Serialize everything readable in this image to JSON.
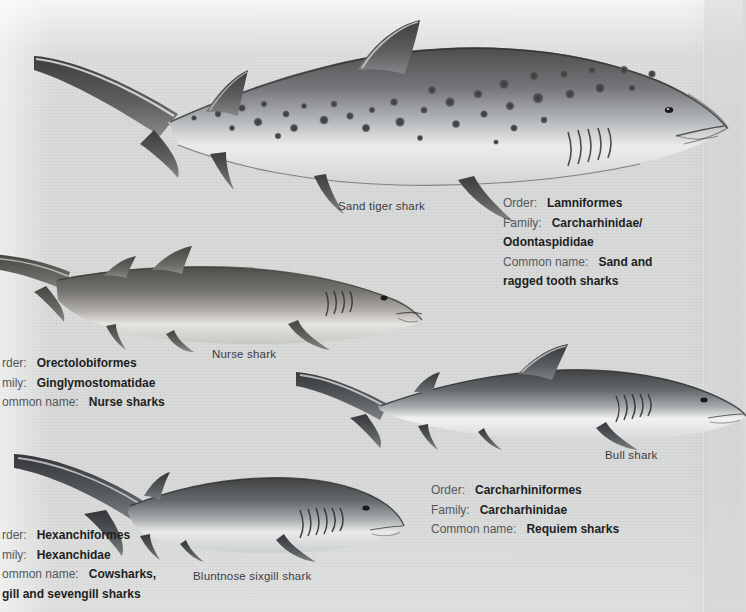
{
  "page": {
    "background_color": "#d7d8d8",
    "ink_color": "#1d1f22"
  },
  "figures": [
    {
      "id": "sand-tiger-shark",
      "caption": "Sand tiger shark",
      "pattern": "spotted",
      "body_color": "#6a6b6c",
      "belly_color": "#eceded",
      "gill_slits": 5
    },
    {
      "id": "nurse-shark",
      "caption": "Nurse shark",
      "pattern": "plain",
      "body_color": "#75736e",
      "belly_color": "#dedcd7",
      "gill_slits": 4
    },
    {
      "id": "bull-shark",
      "caption": "Bull shark",
      "pattern": "plain",
      "body_color": "#5e6163",
      "belly_color": "#f2f3f3",
      "gill_slits": 5
    },
    {
      "id": "bluntnose-sixgill-shark",
      "caption": "Bluntnose sixgill shark",
      "pattern": "plain",
      "body_color": "#5f6163",
      "belly_color": "#e9eaea",
      "gill_slits": 6
    }
  ],
  "taxon_blocks": [
    {
      "id": "lamniformes",
      "order_label": "Order:",
      "order_value": "Lamniformes",
      "family_label": "Family:",
      "family_value": "Carcharhinidae/",
      "family_value_2": "Odontaspididae",
      "common_label": "Common name:",
      "common_value": "Sand and",
      "common_value_2": "ragged tooth sharks"
    },
    {
      "id": "orectolobiformes",
      "order_label": "rder:",
      "order_value": "Orectolobiformes",
      "family_label": "mily:",
      "family_value": "Ginglymostomatidae",
      "common_label": "ommon name:",
      "common_value": "Nurse sharks"
    },
    {
      "id": "carcharhiniformes",
      "order_label": "Order:",
      "order_value": "Carcharhiniformes",
      "family_label": "Family:",
      "family_value": "Carcharhinidae",
      "common_label": "Common name:",
      "common_value": "Requiem sharks"
    },
    {
      "id": "hexanchiformes",
      "order_label": "rder:",
      "order_value": "Hexanchiformes",
      "family_label": "mily:",
      "family_value": "Hexanchidae",
      "common_label": "ommon name:",
      "common_value": "Cowsharks,",
      "common_value_2": "gill and sevengill sharks"
    }
  ]
}
